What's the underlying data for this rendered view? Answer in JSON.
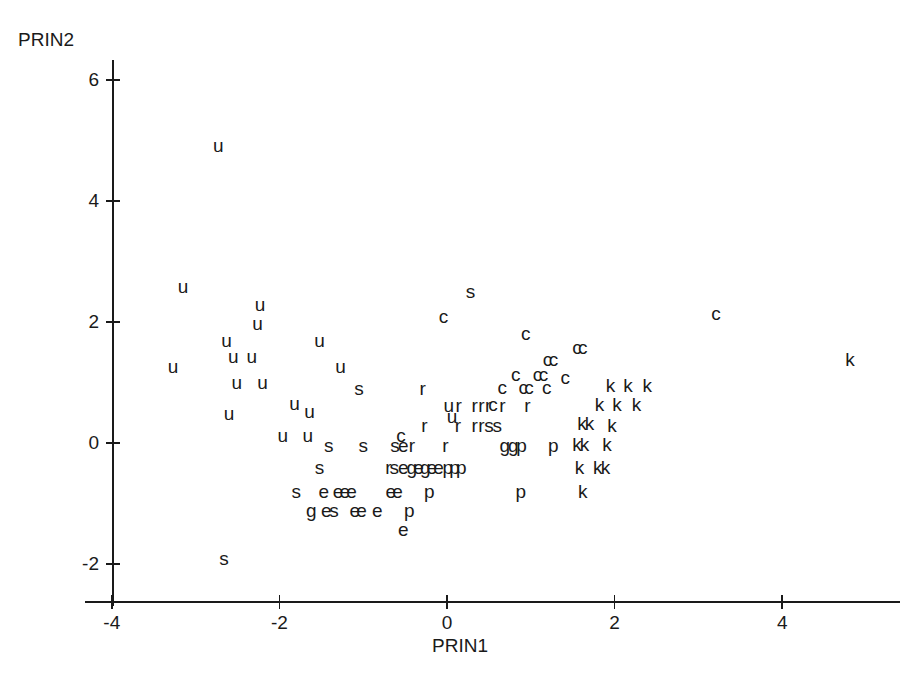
{
  "chart_data": {
    "type": "scatter",
    "title": "",
    "xlabel": "PRIN1",
    "ylabel": "PRIN2",
    "xlim": [
      -4.2,
      5.3
    ],
    "ylim": [
      -2.4,
      6.6
    ],
    "xticks": [
      -4,
      -2,
      0,
      2,
      4
    ],
    "xticklabels": [
      "-4",
      "-2",
      "0",
      "2",
      "4"
    ],
    "yticks": [
      -2,
      0,
      2,
      4,
      6
    ],
    "yticklabels": [
      "-2",
      "0",
      "2",
      "4",
      "6"
    ],
    "grid": false,
    "legend": "none",
    "marker_style": "text-label",
    "group_labels": [
      "u",
      "c",
      "k",
      "s",
      "r",
      "e",
      "g",
      "p"
    ],
    "point_count": 148,
    "points": [
      {
        "label": "u",
        "x": -2.73,
        "y": 4.9
      },
      {
        "label": "u",
        "x": -3.15,
        "y": 2.57
      },
      {
        "label": "u",
        "x": -2.23,
        "y": 2.26
      },
      {
        "label": "u",
        "x": -2.26,
        "y": 1.95
      },
      {
        "label": "u",
        "x": -2.63,
        "y": 1.67
      },
      {
        "label": "u",
        "x": -1.52,
        "y": 1.67
      },
      {
        "label": "u",
        "x": -2.55,
        "y": 1.41
      },
      {
        "label": "u",
        "x": -2.33,
        "y": 1.41
      },
      {
        "label": "u",
        "x": -3.27,
        "y": 1.24
      },
      {
        "label": "u",
        "x": -1.27,
        "y": 1.24
      },
      {
        "label": "u",
        "x": -2.51,
        "y": 0.97
      },
      {
        "label": "u",
        "x": -2.2,
        "y": 0.97
      },
      {
        "label": "u",
        "x": -1.82,
        "y": 0.63
      },
      {
        "label": "u",
        "x": -1.64,
        "y": 0.5
      },
      {
        "label": "u",
        "x": -2.6,
        "y": 0.47
      },
      {
        "label": "u",
        "x": -1.96,
        "y": 0.1
      },
      {
        "label": "u",
        "x": -1.66,
        "y": 0.1
      },
      {
        "label": "u",
        "x": 0.06,
        "y": 0.42
      },
      {
        "label": "s",
        "x": 0.28,
        "y": 2.48
      },
      {
        "label": "c",
        "x": -0.04,
        "y": 2.06
      },
      {
        "label": "c",
        "x": 3.21,
        "y": 2.12
      },
      {
        "label": "c",
        "x": 0.94,
        "y": 1.79
      },
      {
        "label": "c",
        "x": 1.55,
        "y": 1.55
      },
      {
        "label": "c",
        "x": 1.62,
        "y": 1.55
      },
      {
        "label": "c",
        "x": 1.2,
        "y": 1.36
      },
      {
        "label": "c",
        "x": 1.27,
        "y": 1.36
      },
      {
        "label": "c",
        "x": 0.82,
        "y": 1.1
      },
      {
        "label": "c",
        "x": 1.08,
        "y": 1.1
      },
      {
        "label": "c",
        "x": 1.15,
        "y": 1.1
      },
      {
        "label": "c",
        "x": 1.41,
        "y": 1.06
      },
      {
        "label": "c",
        "x": 0.66,
        "y": 0.9
      },
      {
        "label": "c",
        "x": 0.91,
        "y": 0.9
      },
      {
        "label": "c",
        "x": 0.98,
        "y": 0.9
      },
      {
        "label": "c",
        "x": 1.19,
        "y": 0.9
      },
      {
        "label": "c",
        "x": 0.55,
        "y": 0.62
      },
      {
        "label": "c",
        "x": -0.55,
        "y": 0.1
      },
      {
        "label": "k",
        "x": 4.81,
        "y": 1.35
      },
      {
        "label": "k",
        "x": 1.95,
        "y": 0.93
      },
      {
        "label": "k",
        "x": 2.16,
        "y": 0.93
      },
      {
        "label": "k",
        "x": 2.39,
        "y": 0.93
      },
      {
        "label": "k",
        "x": 1.82,
        "y": 0.62
      },
      {
        "label": "k",
        "x": 2.03,
        "y": 0.62
      },
      {
        "label": "k",
        "x": 2.26,
        "y": 0.62
      },
      {
        "label": "k",
        "x": 1.61,
        "y": 0.3
      },
      {
        "label": "k",
        "x": 1.7,
        "y": 0.3
      },
      {
        "label": "k",
        "x": 1.97,
        "y": 0.26
      },
      {
        "label": "k",
        "x": 1.55,
        "y": -0.05
      },
      {
        "label": "k",
        "x": 1.64,
        "y": -0.05
      },
      {
        "label": "k",
        "x": 1.91,
        "y": -0.05
      },
      {
        "label": "k",
        "x": 1.58,
        "y": -0.43
      },
      {
        "label": "k",
        "x": 1.8,
        "y": -0.43
      },
      {
        "label": "k",
        "x": 1.89,
        "y": -0.43
      },
      {
        "label": "k",
        "x": 1.62,
        "y": -0.82
      },
      {
        "label": "r",
        "x": -0.29,
        "y": 0.88
      },
      {
        "label": "r",
        "x": 0.14,
        "y": 0.6
      },
      {
        "label": "r",
        "x": 0.33,
        "y": 0.6
      },
      {
        "label": "r",
        "x": 0.41,
        "y": 0.6
      },
      {
        "label": "r",
        "x": 0.49,
        "y": 0.6
      },
      {
        "label": "r",
        "x": 0.66,
        "y": 0.6
      },
      {
        "label": "r",
        "x": 0.96,
        "y": 0.6
      },
      {
        "label": "r",
        "x": -0.27,
        "y": 0.26
      },
      {
        "label": "r",
        "x": 0.13,
        "y": 0.26
      },
      {
        "label": "r",
        "x": 0.33,
        "y": 0.26
      },
      {
        "label": "r",
        "x": 0.41,
        "y": 0.26
      },
      {
        "label": "r",
        "x": -0.42,
        "y": -0.07
      },
      {
        "label": "r",
        "x": -0.02,
        "y": -0.07
      },
      {
        "label": "r",
        "x": -0.7,
        "y": -0.43
      },
      {
        "label": "u",
        "x": 0.02,
        "y": 0.6
      },
      {
        "label": "s",
        "x": -1.05,
        "y": 0.88
      },
      {
        "label": "s",
        "x": 0.5,
        "y": 0.26
      },
      {
        "label": "s",
        "x": 0.6,
        "y": 0.26
      },
      {
        "label": "s",
        "x": -1.41,
        "y": -0.07
      },
      {
        "label": "s",
        "x": -1.0,
        "y": -0.07
      },
      {
        "label": "s",
        "x": -0.62,
        "y": -0.07
      },
      {
        "label": "s",
        "x": -1.52,
        "y": -0.43
      },
      {
        "label": "s",
        "x": -0.63,
        "y": -0.43
      },
      {
        "label": "s",
        "x": -1.8,
        "y": -0.82
      },
      {
        "label": "s",
        "x": -1.35,
        "y": -1.14
      },
      {
        "label": "s",
        "x": -2.66,
        "y": -1.93
      },
      {
        "label": "e",
        "x": -0.52,
        "y": -0.07
      },
      {
        "label": "e",
        "x": -0.52,
        "y": -0.43
      },
      {
        "label": "e",
        "x": -0.34,
        "y": -0.43
      },
      {
        "label": "e",
        "x": -0.18,
        "y": -0.43
      },
      {
        "label": "e",
        "x": -0.1,
        "y": -0.43
      },
      {
        "label": "e",
        "x": -1.47,
        "y": -0.82
      },
      {
        "label": "e",
        "x": -1.3,
        "y": -0.82
      },
      {
        "label": "e",
        "x": -1.22,
        "y": -0.82
      },
      {
        "label": "e",
        "x": -1.14,
        "y": -0.82
      },
      {
        "label": "e",
        "x": -0.67,
        "y": -0.82
      },
      {
        "label": "e",
        "x": -0.59,
        "y": -0.82
      },
      {
        "label": "e",
        "x": -1.44,
        "y": -1.14
      },
      {
        "label": "e",
        "x": -1.1,
        "y": -1.14
      },
      {
        "label": "e",
        "x": -1.02,
        "y": -1.14
      },
      {
        "label": "e",
        "x": -0.83,
        "y": -1.14
      },
      {
        "label": "e",
        "x": -0.52,
        "y": -1.45
      },
      {
        "label": "g",
        "x": 0.69,
        "y": -0.07
      },
      {
        "label": "g",
        "x": 0.79,
        "y": -0.07
      },
      {
        "label": "g",
        "x": -0.42,
        "y": -0.43
      },
      {
        "label": "g",
        "x": -0.26,
        "y": -0.43
      },
      {
        "label": "g",
        "x": -1.62,
        "y": -1.14
      },
      {
        "label": "p",
        "x": 0.89,
        "y": -0.07
      },
      {
        "label": "p",
        "x": 1.27,
        "y": -0.07
      },
      {
        "label": "p",
        "x": 0.01,
        "y": -0.43
      },
      {
        "label": "p",
        "x": 0.09,
        "y": -0.43
      },
      {
        "label": "p",
        "x": 0.17,
        "y": -0.43
      },
      {
        "label": "p",
        "x": -0.21,
        "y": -0.82
      },
      {
        "label": "p",
        "x": 0.88,
        "y": -0.82
      },
      {
        "label": "p",
        "x": -0.45,
        "y": -1.14
      }
    ]
  },
  "axes": {
    "x_axis_name": "PRIN1",
    "y_axis_name": "PRIN2"
  }
}
